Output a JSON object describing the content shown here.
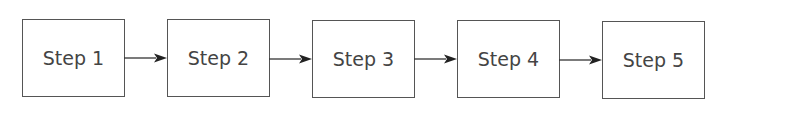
{
  "diagram": {
    "type": "linear-flow",
    "steps": [
      {
        "label": "Step 1"
      },
      {
        "label": "Step 2"
      },
      {
        "label": "Step 3"
      },
      {
        "label": "Step 4"
      },
      {
        "label": "Step 5"
      }
    ],
    "connectors": [
      {
        "from": "Step 1",
        "to": "Step 2",
        "icon": "arrow-right-icon"
      },
      {
        "from": "Step 2",
        "to": "Step 3",
        "icon": "arrow-right-icon"
      },
      {
        "from": "Step 3",
        "to": "Step 4",
        "icon": "arrow-right-icon"
      },
      {
        "from": "Step 4",
        "to": "Step 5",
        "icon": "arrow-right-icon"
      }
    ],
    "colors": {
      "stroke": "#555555",
      "text": "#444444",
      "background": "#ffffff"
    }
  }
}
